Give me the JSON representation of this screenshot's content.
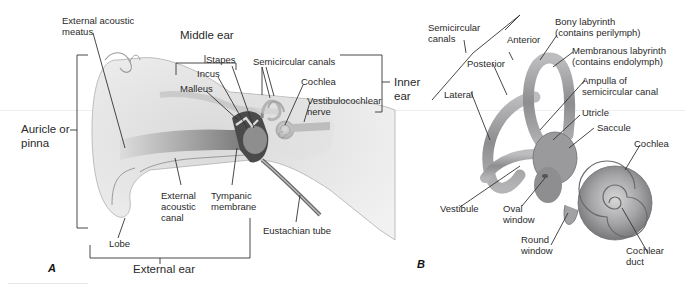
{
  "panel_a": {
    "letter": "A",
    "labels": {
      "external_acoustic_meatus": "External acoustic\nmeatus",
      "external_acoustic_meatus_l1": "External acoustic",
      "external_acoustic_meatus_l2": "meatus",
      "middle_ear": "Middle ear",
      "stapes": "Stapes",
      "incus": "Incus",
      "malleus": "Malleus",
      "semicircular_canals": "Semicircular canals",
      "cochlea": "Cochlea",
      "vestibulocochlear_nerve_l1": "Vestibulocochlear",
      "vestibulocochlear_nerve_l2": "nerve",
      "inner_ear_l1": "Inner",
      "inner_ear_l2": "ear",
      "auricle_l1": "Auricle or",
      "auricle_l2": "pinna",
      "external_acoustic_canal_l1": "External",
      "external_acoustic_canal_l2": "acoustic",
      "external_acoustic_canal_l3": "canal",
      "tympanic_membrane_l1": "Tympanic",
      "tympanic_membrane_l2": "membrane",
      "eustachian_tube": "Eustachian tube",
      "lobe": "Lobe",
      "external_ear": "External ear"
    }
  },
  "panel_b": {
    "letter": "B",
    "labels": {
      "semicircular_canals_l1": "Semicircular",
      "semicircular_canals_l2": "canals",
      "anterior": "Anterior",
      "posterior": "Posterior",
      "lateral": "Lateral",
      "bony_labyrinth_l1": "Bony labyrinth",
      "bony_labyrinth_l2": "(contains perilymph)",
      "membranous_labyrinth_l1": "Membranous labyrinth",
      "membranous_labyrinth_l2": "(contains endolymph)",
      "ampulla_l1": "Ampulla of",
      "ampulla_l2": "semicircular canal",
      "utricle": "Utricle",
      "saccule": "Saccule",
      "cochlea": "Cochlea",
      "vestibule": "Vestibule",
      "oval_window_l1": "Oval",
      "oval_window_l2": "window",
      "round_window_l1": "Round",
      "round_window_l2": "window",
      "cochlear_duct_l1": "Cochlear",
      "cochlear_duct_l2": "duct"
    }
  },
  "colors": {
    "tissue_light": "#e4e4e4",
    "tissue_mid": "#c8c8c8",
    "tissue_dark": "#5a5a5a",
    "bone_gray": "#a9a9ab",
    "leader_line": "#333333"
  }
}
